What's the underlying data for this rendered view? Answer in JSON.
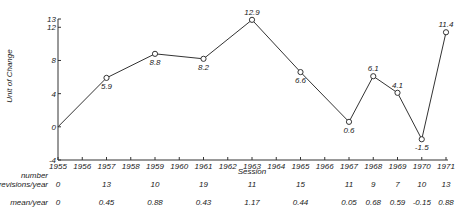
{
  "chart_data": {
    "type": "line",
    "title": "",
    "xlabel": "Session",
    "ylabel": "Unit of Change",
    "ylim": [
      -4,
      13
    ],
    "xlim": [
      1955,
      1971
    ],
    "yticks": [
      "13",
      "12",
      "8",
      "4",
      "0",
      "-4"
    ],
    "ytick_values": [
      13,
      12,
      8,
      4,
      0,
      -4
    ],
    "xticks": [
      "1955",
      "1956",
      "1957",
      "1958",
      "1959",
      "1960",
      "1961",
      "1962",
      "1963",
      "1964",
      "1965",
      "1966",
      "1967",
      "1968",
      "1969",
      "1970",
      "1971"
    ],
    "grid": false,
    "series": [
      {
        "name": "Unit of Change",
        "x": [
          1955,
          1957,
          1959,
          1961,
          1963,
          1965,
          1967,
          1968,
          1969,
          1970,
          1971
        ],
        "y": [
          0,
          5.9,
          8.8,
          8.2,
          12.9,
          6.6,
          0.6,
          6.1,
          4.1,
          -1.5,
          11.4
        ],
        "labels": [
          "",
          "5.9",
          "8.8",
          "8.2",
          "12.9",
          "6.6",
          "0.6",
          "6.1",
          "4.1",
          "-1.5",
          "11.4"
        ],
        "label_pos": [
          "none",
          "below",
          "below",
          "below",
          "above",
          "below",
          "below",
          "above",
          "above",
          "below",
          "above"
        ]
      }
    ],
    "table": {
      "rows": [
        {
          "label": "number revisions/year",
          "label_lines": [
            "number",
            "revisions/year"
          ],
          "x": [
            1955,
            1957,
            1959,
            1961,
            1963,
            1965,
            1967,
            1968,
            1969,
            1970,
            1971
          ],
          "values": [
            "0",
            "13",
            "10",
            "19",
            "11",
            "15",
            "11",
            "9",
            "7",
            "10",
            "13"
          ]
        },
        {
          "label": "mean/year",
          "label_lines": [
            "mean/year"
          ],
          "x": [
            1955,
            1957,
            1959,
            1961,
            1963,
            1965,
            1967,
            1968,
            1969,
            1970,
            1971
          ],
          "values": [
            "0",
            "0.45",
            "0.88",
            "0.43",
            "1.17",
            "0.44",
            "0.05",
            "0.68",
            "0.59",
            "-0.15",
            "0.88"
          ]
        }
      ]
    }
  }
}
